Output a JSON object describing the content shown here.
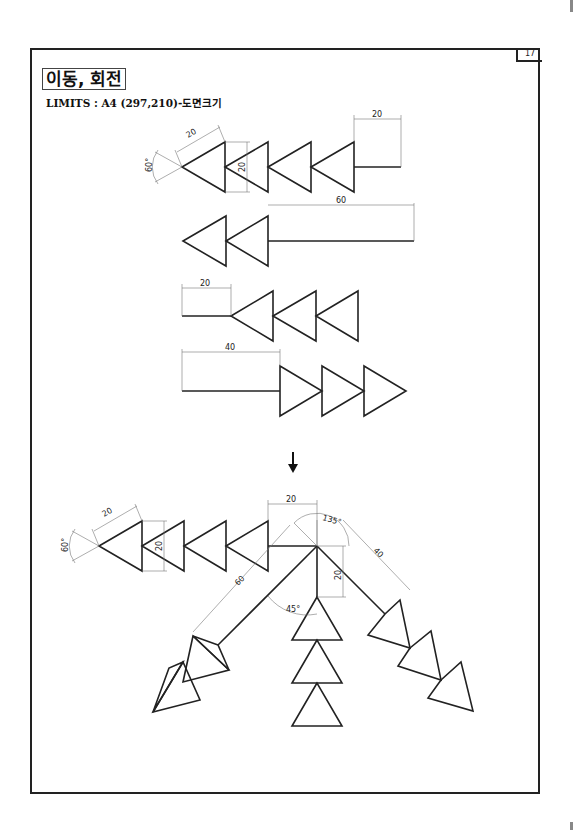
{
  "page": {
    "number": "17",
    "title": "이동, 회전",
    "limits": "LIMITS : A4 (297,210)-도면크기"
  },
  "figures": {
    "fig1": {
      "angle": "60°",
      "side": "20",
      "height": "20",
      "tail": "20"
    },
    "fig2": {
      "tail": "60"
    },
    "fig3": {
      "tail": "20"
    },
    "fig4": {
      "tail": "40"
    },
    "arrow": "down-arrow-icon",
    "result": {
      "angle": "60°",
      "side": "20",
      "height": "20",
      "tail": "20",
      "rot_angle": "135°",
      "branch_left": "60",
      "branch_right": "40",
      "branch_down": "20",
      "angle_45": "45°"
    }
  }
}
